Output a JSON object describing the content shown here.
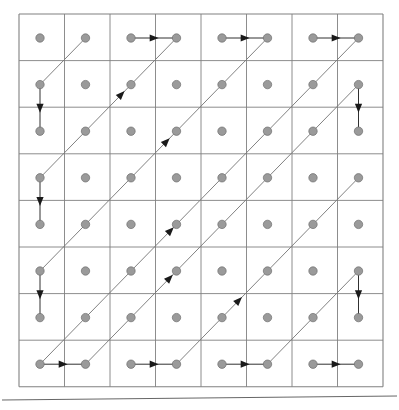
{
  "figure": {
    "kind": "lattice-path-diagram",
    "caption": "",
    "width": 399,
    "height": 410
  },
  "colors": {
    "background": "#ffffff",
    "grid_line": "#808080",
    "grid_border": "#6e6e6e",
    "node_fill": "#9a9a9a",
    "node_stroke": "#6f6f6f",
    "path_line": "#7a7a7a",
    "arrow_head": "#1a1a1a",
    "rule": "#555555"
  },
  "grid": {
    "rows": 8,
    "cols": 8,
    "x0": 19,
    "y0": 14,
    "cell_w": 45.5,
    "cell_h": 46.6,
    "node_offset_x": 21,
    "node_offset_y": 24,
    "node_radius": 4.2,
    "line_width": 1
  },
  "chart_data": {
    "type": "scatter",
    "title": "",
    "xlabel": "",
    "ylabel": "",
    "grid": true,
    "legend": null,
    "xlim": [
      0,
      8
    ],
    "ylim": [
      0,
      8
    ],
    "nodes": [
      {
        "col": 0,
        "row": 0
      },
      {
        "col": 1,
        "row": 0
      },
      {
        "col": 2,
        "row": 0
      },
      {
        "col": 3,
        "row": 0
      },
      {
        "col": 4,
        "row": 0
      },
      {
        "col": 5,
        "row": 0
      },
      {
        "col": 6,
        "row": 0
      },
      {
        "col": 7,
        "row": 0
      },
      {
        "col": 0,
        "row": 1
      },
      {
        "col": 1,
        "row": 1
      },
      {
        "col": 2,
        "row": 1
      },
      {
        "col": 3,
        "row": 1
      },
      {
        "col": 4,
        "row": 1
      },
      {
        "col": 5,
        "row": 1
      },
      {
        "col": 6,
        "row": 1
      },
      {
        "col": 7,
        "row": 1
      },
      {
        "col": 0,
        "row": 2
      },
      {
        "col": 1,
        "row": 2
      },
      {
        "col": 2,
        "row": 2
      },
      {
        "col": 3,
        "row": 2
      },
      {
        "col": 4,
        "row": 2
      },
      {
        "col": 5,
        "row": 2
      },
      {
        "col": 6,
        "row": 2
      },
      {
        "col": 7,
        "row": 2
      },
      {
        "col": 0,
        "row": 3
      },
      {
        "col": 1,
        "row": 3
      },
      {
        "col": 2,
        "row": 3
      },
      {
        "col": 3,
        "row": 3
      },
      {
        "col": 4,
        "row": 3
      },
      {
        "col": 5,
        "row": 3
      },
      {
        "col": 6,
        "row": 3
      },
      {
        "col": 7,
        "row": 3
      },
      {
        "col": 0,
        "row": 4
      },
      {
        "col": 1,
        "row": 4
      },
      {
        "col": 2,
        "row": 4
      },
      {
        "col": 3,
        "row": 4
      },
      {
        "col": 4,
        "row": 4
      },
      {
        "col": 5,
        "row": 4
      },
      {
        "col": 6,
        "row": 4
      },
      {
        "col": 7,
        "row": 4
      },
      {
        "col": 0,
        "row": 5
      },
      {
        "col": 1,
        "row": 5
      },
      {
        "col": 2,
        "row": 5
      },
      {
        "col": 3,
        "row": 5
      },
      {
        "col": 4,
        "row": 5
      },
      {
        "col": 5,
        "row": 5
      },
      {
        "col": 6,
        "row": 5
      },
      {
        "col": 7,
        "row": 5
      },
      {
        "col": 0,
        "row": 6
      },
      {
        "col": 1,
        "row": 6
      },
      {
        "col": 2,
        "row": 6
      },
      {
        "col": 3,
        "row": 6
      },
      {
        "col": 4,
        "row": 6
      },
      {
        "col": 5,
        "row": 6
      },
      {
        "col": 6,
        "row": 6
      },
      {
        "col": 7,
        "row": 6
      },
      {
        "col": 0,
        "row": 7
      },
      {
        "col": 1,
        "row": 7
      },
      {
        "col": 2,
        "row": 7
      },
      {
        "col": 3,
        "row": 7
      },
      {
        "col": 4,
        "row": 7
      },
      {
        "col": 5,
        "row": 7
      },
      {
        "col": 6,
        "row": 7
      },
      {
        "col": 7,
        "row": 7
      }
    ],
    "diagonal_paths": [
      {
        "from": {
          "col": 0,
          "row": 1
        },
        "to": {
          "col": 1,
          "row": 0
        },
        "arrow": false
      },
      {
        "from": {
          "col": 0,
          "row": 3
        },
        "to": {
          "col": 3,
          "row": 0
        },
        "arrow": true,
        "arrow_at": 0.62
      },
      {
        "from": {
          "col": 0,
          "row": 5
        },
        "to": {
          "col": 5,
          "row": 0
        },
        "arrow": true,
        "arrow_at": 0.57
      },
      {
        "from": {
          "col": 0,
          "row": 7
        },
        "to": {
          "col": 7,
          "row": 0
        },
        "arrow": true,
        "arrow_at": 0.42
      },
      {
        "from": {
          "col": 1,
          "row": 7
        },
        "to": {
          "col": 7,
          "row": 1
        },
        "arrow": true,
        "arrow_at": 0.32
      },
      {
        "from": {
          "col": 3,
          "row": 7
        },
        "to": {
          "col": 7,
          "row": 3
        },
        "arrow": true,
        "arrow_at": 0.36
      },
      {
        "from": {
          "col": 5,
          "row": 7
        },
        "to": {
          "col": 7,
          "row": 5
        },
        "arrow": false
      },
      {
        "from": {
          "col": 7,
          "row": 7
        },
        "to": {
          "col": 7,
          "row": 7
        },
        "arrow": false
      }
    ],
    "connector_arrows": [
      {
        "kind": "vertical",
        "from": {
          "col": 0,
          "row": 1
        },
        "to": {
          "col": 0,
          "row": 2
        }
      },
      {
        "kind": "horizontal",
        "from": {
          "col": 2,
          "row": 0
        },
        "to": {
          "col": 3,
          "row": 0
        }
      },
      {
        "kind": "horizontal",
        "from": {
          "col": 4,
          "row": 0
        },
        "to": {
          "col": 5,
          "row": 0
        }
      },
      {
        "kind": "horizontal",
        "from": {
          "col": 6,
          "row": 0
        },
        "to": {
          "col": 7,
          "row": 0
        }
      },
      {
        "kind": "vertical",
        "from": {
          "col": 7,
          "row": 1
        },
        "to": {
          "col": 7,
          "row": 2
        }
      },
      {
        "kind": "vertical",
        "from": {
          "col": 0,
          "row": 3
        },
        "to": {
          "col": 0,
          "row": 4
        }
      },
      {
        "kind": "vertical",
        "from": {
          "col": 0,
          "row": 5
        },
        "to": {
          "col": 0,
          "row": 6
        }
      },
      {
        "kind": "vertical",
        "from": {
          "col": 7,
          "row": 5
        },
        "to": {
          "col": 7,
          "row": 6
        }
      },
      {
        "kind": "horizontal",
        "from": {
          "col": 0,
          "row": 7
        },
        "to": {
          "col": 1,
          "row": 7
        }
      },
      {
        "kind": "horizontal",
        "from": {
          "col": 2,
          "row": 7
        },
        "to": {
          "col": 3,
          "row": 7
        }
      },
      {
        "kind": "horizontal",
        "from": {
          "col": 4,
          "row": 7
        },
        "to": {
          "col": 5,
          "row": 7
        }
      },
      {
        "kind": "horizontal",
        "from": {
          "col": 6,
          "row": 7
        },
        "to": {
          "col": 7,
          "row": 7
        }
      }
    ],
    "bottom_rule": {
      "x1": 2,
      "y1": 400,
      "x2": 397,
      "y2": 396
    }
  }
}
